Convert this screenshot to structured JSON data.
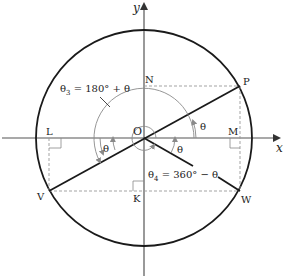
{
  "diagram": {
    "axes": {
      "x_label": "x",
      "y_label": "y"
    },
    "origin_label": "O",
    "points": {
      "P": "P",
      "V": "V",
      "W": "W",
      "N": "N",
      "M": "M",
      "L": "L",
      "K": "K"
    },
    "angle_labels": {
      "theta_first": "θ",
      "theta_third_small": "θ",
      "theta_fourth_small": "θ",
      "theta3_eq": "θ",
      "theta3_sub": "3",
      "theta3_rhs": " = 180° + θ",
      "theta4_eq": "θ",
      "theta4_sub": "4",
      "theta4_rhs": " = 360° − θ"
    },
    "colors": {
      "circle": "#1a1a1a",
      "axis": "#555555",
      "guide": "#999999",
      "arc": "#8a8a8a"
    }
  }
}
